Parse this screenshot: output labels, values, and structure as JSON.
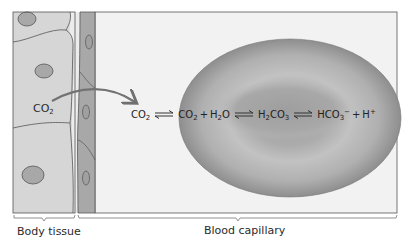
{
  "diagram": {
    "regions": {
      "body_tissue_label": "Body tissue",
      "blood_capillary_label": "Blood capillary"
    },
    "tissue_co2": {
      "base": "CO",
      "sub": "2"
    },
    "equation": {
      "terms": [
        {
          "id": "co2_in",
          "base": "CO",
          "sub": "2"
        },
        {
          "id": "co2",
          "base": "CO",
          "sub": "2",
          "suffix": "+"
        },
        {
          "id": "h2o",
          "base": "H",
          "sub": "2",
          "tail": "O"
        },
        {
          "id": "h2co3",
          "base": "H",
          "sub": "2",
          "tail": "CO",
          "sub2": "3"
        },
        {
          "id": "hco3",
          "base": "HCO",
          "sub": "3",
          "sup": "−",
          "suffix": "+"
        },
        {
          "id": "h",
          "base": "H",
          "sup": "+"
        }
      ],
      "plus": "+"
    },
    "colors": {
      "tissue_fill": "#d9d9d9",
      "capillary_wall": "#a9a9a9",
      "capillary_interior": "#f1f1f1",
      "rbc_outer": "#9a9a9a",
      "rbc_inner": "#b8b8b8",
      "arrow": "#7a7a7a",
      "outline": "#555555"
    }
  }
}
